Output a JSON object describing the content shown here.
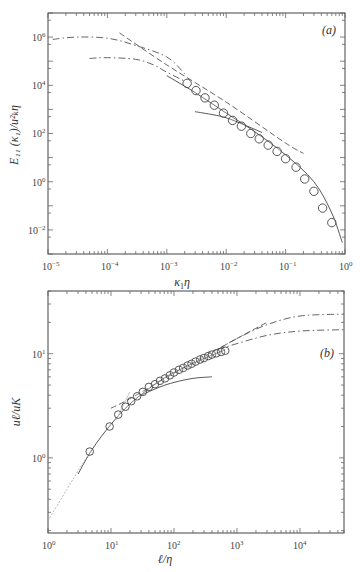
{
  "chart_data": [
    {
      "panel": "(a)",
      "type": "line",
      "xscale": "log",
      "yscale": "log",
      "xlabel": "κ1η",
      "ylabel": "E11(κ1)/uK²η",
      "xlim": [
        1e-05,
        1
      ],
      "ylim": [
        0.001,
        10000000.0
      ],
      "xticks": [
        "10^-5",
        "10^-4",
        "10^-3",
        "10^-2",
        "10^-1",
        "10^0"
      ],
      "yticks": [
        "10^-2",
        "10^0",
        "10^2",
        "10^4",
        "10^6"
      ],
      "grid": false,
      "series": [
        {
          "name": "measured (circles)",
          "style": "markers",
          "x": [
            0.0022,
            0.0031,
            0.0044,
            0.0063,
            0.009,
            0.0128,
            0.018,
            0.026,
            0.036,
            0.051,
            0.072,
            0.1,
            0.15,
            0.21,
            0.3,
            0.42,
            0.6
          ],
          "y": [
            12000,
            6000,
            3000,
            1500,
            700,
            350,
            200,
            100,
            60,
            33,
            18,
            9,
            4,
            1.3,
            0.4,
            0.08,
            0.02
          ]
        },
        {
          "name": "model spectrum (solid)",
          "style": "solid",
          "x": [
            0.001,
            0.003,
            0.01,
            0.03,
            0.1,
            0.3,
            0.6,
            0.9
          ],
          "y": [
            25000,
            5000,
            700,
            120,
            13,
            1.0,
            0.05,
            0.003
          ]
        },
        {
          "name": "low-Re model (solid, short)",
          "style": "solid",
          "x": [
            0.003,
            0.006,
            0.01,
            0.02,
            0.04
          ],
          "y": [
            800,
            600,
            450,
            230,
            110
          ]
        },
        {
          "name": "model high Re (dash-dot, upper)",
          "style": "dashdot",
          "x": [
            1.2e-05,
            3e-05,
            0.0001,
            0.0003,
            0.001,
            0.002
          ],
          "y": [
            800000,
            1000000,
            900000,
            450000,
            150000,
            30000
          ]
        },
        {
          "name": "model lower Re (dash-dot, lower)",
          "style": "dashdot",
          "x": [
            5e-05,
            0.0001,
            0.0003,
            0.0006,
            0.001,
            0.002
          ],
          "y": [
            130000,
            140000,
            120000,
            70000,
            35000,
            15000
          ]
        },
        {
          "name": "-5/3 power law (dashed)",
          "style": "dashed",
          "x": [
            0.00016,
            0.001,
            0.01,
            0.1,
            0.2
          ],
          "y": [
            1500000,
            70000,
            2000,
            40,
            15
          ]
        }
      ]
    },
    {
      "panel": "(b)",
      "type": "line",
      "xscale": "log",
      "yscale": "log",
      "xlabel": "ℓ/η",
      "ylabel": "uℓ/uK",
      "xlim": [
        1,
        50000
      ],
      "ylim": [
        0.19,
        40
      ],
      "xticks": [
        "10^0",
        "10^1",
        "10^2",
        "10^3",
        "10^4"
      ],
      "yticks": [
        "10^0",
        "10^1"
      ],
      "grid": false,
      "series": [
        {
          "name": "measured (circles)",
          "style": "markers",
          "x": [
            4.6,
            9.5,
            13,
            17,
            21,
            26,
            32,
            40,
            50,
            60,
            72,
            86,
            100,
            120,
            140,
            165,
            190,
            220,
            260,
            300,
            350,
            400,
            470,
            560,
            650
          ],
          "y": [
            1.15,
            2.0,
            2.6,
            3.1,
            3.5,
            3.9,
            4.3,
            4.8,
            5.1,
            5.5,
            5.8,
            6.2,
            6.6,
            7.0,
            7.3,
            7.7,
            8.0,
            8.4,
            8.8,
            9.1,
            9.5,
            9.8,
            10.1,
            10.4,
            10.7
          ]
        },
        {
          "name": "model (solid)",
          "style": "solid",
          "x": [
            3,
            5,
            10,
            20,
            50,
            100,
            300,
            650
          ],
          "y": [
            0.7,
            1.2,
            2.1,
            3.3,
            5.1,
            6.6,
            9.0,
            10.9
          ]
        },
        {
          "name": "low-Re model (solid, short)",
          "style": "solid",
          "x": [
            30,
            60,
            100,
            200,
            400
          ],
          "y": [
            4.0,
            4.8,
            5.3,
            5.8,
            6.0
          ]
        },
        {
          "name": "dissipation-range ℓ^1 (dotted)",
          "style": "dotted",
          "x": [
            1,
            2,
            3,
            5
          ],
          "y": [
            0.25,
            0.5,
            0.75,
            1.2
          ]
        },
        {
          "name": "ℓ^1/3 inertial (dashed)",
          "style": "dashed",
          "x": [
            10,
            20,
            100,
            1000,
            3000
          ],
          "y": [
            3.0,
            3.7,
            6.5,
            14,
            20
          ]
        },
        {
          "name": "high-Re model (dash-dot upper)",
          "style": "dashdot",
          "x": [
            500,
            1000,
            3000,
            10000,
            50000
          ],
          "y": [
            11,
            14,
            19,
            23,
            24
          ]
        },
        {
          "name": "lower-Re model (dash-dot lower)",
          "style": "dashdot",
          "x": [
            500,
            1000,
            3000,
            10000,
            50000
          ],
          "y": [
            11,
            12.5,
            15,
            16.5,
            17
          ]
        },
        {
          "name": "steep grey line",
          "style": "grey",
          "x": [
            12,
            20
          ],
          "y": [
            2.3,
            4.3
          ]
        }
      ]
    }
  ],
  "labels": {
    "panel_a": "(a)",
    "panel_b": "(b)",
    "a_xlabel_main": "κ",
    "a_xlabel_sub": "1",
    "a_xlabel_tail": "η",
    "a_ylabel": "E₁₁ (κ₁)/u²ₖη",
    "b_xlabel": "ℓ/η",
    "b_ylabel": "uℓ/uK"
  },
  "ticks": {
    "a_x": [
      "10",
      "10",
      "10",
      "10",
      "10",
      "10"
    ],
    "a_x_exp": [
      "−5",
      "−4",
      "−3",
      "−2",
      "−1",
      "0"
    ],
    "a_y": [
      "10",
      "10",
      "10",
      "10",
      "10"
    ],
    "a_y_exp": [
      "6",
      "4",
      "2",
      "0",
      "−2"
    ],
    "b_x": [
      "10",
      "10",
      "10",
      "10",
      "10"
    ],
    "b_x_exp": [
      "0",
      "1",
      "2",
      "3",
      "4"
    ],
    "b_y": [
      "10",
      "10"
    ],
    "b_y_exp": [
      "1",
      "0"
    ]
  }
}
